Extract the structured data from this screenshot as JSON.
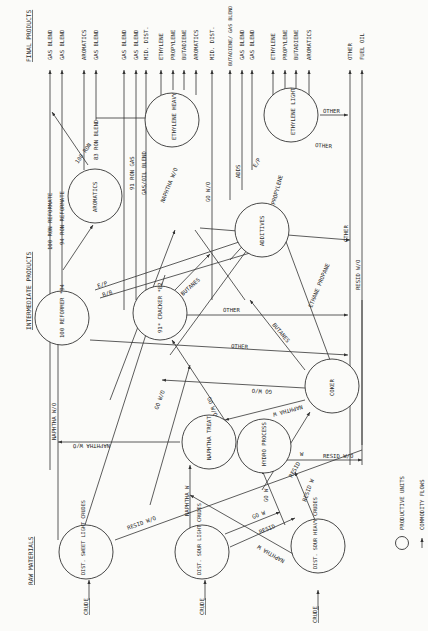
{
  "headers": {
    "final_products": "FINAL PRODUCTS",
    "intermediate_products": "INTERMEDIATE PRODUCTS",
    "raw_materials": "RAW MATERIALS"
  },
  "final_products": [
    "GAS BLEND",
    "GAS BLEND",
    "AROMATICS",
    "GAS BLEND",
    "GAS BLEND",
    "GAS BLEND",
    "MID. DIST.",
    "ETHYLENE",
    "PROPYLENE",
    "BUTADIENE",
    "AROMATICS",
    "MID. DIST.",
    "BUTADIENE/ GAS BLEND",
    "GAS BLEND",
    "GAS BLEND",
    "ETHYLENE",
    "PROPYLENE",
    "BUTADIENE",
    "AROMATICS",
    "OTHER",
    "FUEL OIL"
  ],
  "nodes": {
    "dist_sweet_light": "DIST. SWEET LIGHT CRUDES",
    "dist_sour_light": "DIST. SOUR LIGHT CRUDES",
    "dist_sour_heavy": "DIST. SOUR HEAVY CRUDES",
    "naphtha_treat": "NAPHTHA TREAT",
    "hydro_process": "HYDRO PROCESS",
    "coker": "COKER",
    "reformer": "100 REFORMER *94",
    "cracker": "91* CRACKER *82",
    "additives": "ADDITIVES",
    "aromatics": "AROMATICS",
    "ethylene_heavy": "ETHYLENE HEAVY",
    "ethylene_light": "ETHYLENE LIGHT"
  },
  "inputs": [
    "CRUDE",
    "CRUDE",
    "CRUDE"
  ],
  "flows": {
    "f100_ron_reformate": "100 RON REFORMATE",
    "f94_ron_reformate": "94 RON REFORMATE",
    "f100_ron": "100 RON",
    "f83_ron_blend": "83 RON BLEND",
    "f91_ron_gas": "91 RON GAS",
    "gas_oil_blend": "GAS/OIL BLEND",
    "naphtha_wo_top": "NAPHTHA W/O",
    "go_wo_top": "GO W/O",
    "adds": "ADDS",
    "ep_top": "E/P",
    "propylene": "PROPYLENE",
    "other_eth_light": "OTHER",
    "other_eth_heavy": "OTHER",
    "ep": "E/P",
    "bb": "B/B",
    "butanes": "BUTANES",
    "other_cracker": "OTHER",
    "other_reformer": "OTHER",
    "other_right": "OTHER",
    "resid_wo_right": "RESID W/O",
    "ethane_propane": "ETHANE PROPANE",
    "butanes_coker": "BUTANES",
    "go_wo_coker": "GO W/O",
    "naphtha_w_coker": "NAPHTHA W",
    "go_wo_mid": "GO W/O",
    "go_wo_left": "GO W/O",
    "naphtha_wo_left": "NAPHTHA W/O",
    "naphtha_wo_h": "NAPHTHA W/O",
    "resid_wo_sweet": "RESID W/O",
    "resid_wo_hydro": "RESID W/O",
    "w": "W",
    "resid_hydro": "RESID",
    "naphtha_w_light": "NAPHTHA W",
    "go_w": "GO W",
    "resid": "RESID",
    "naphtha_w_heavy": "NAPHTHA W",
    "go_w_heavy": "GO W",
    "resid_w_heavy": "RESID W"
  },
  "legend": {
    "productive_units": "PRODUCTIVE UNITS",
    "commodity_flows": "COMMODITY FLOWS"
  }
}
